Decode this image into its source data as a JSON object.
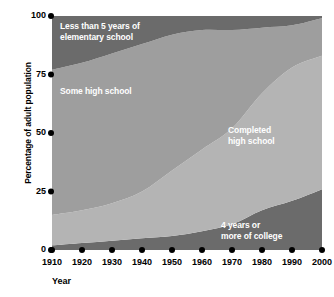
{
  "chart_data": {
    "type": "area",
    "title": "",
    "xlabel": "Year",
    "ylabel": "Percentage of adult population",
    "xlim": [
      1910,
      2000
    ],
    "ylim": [
      0,
      100
    ],
    "grid": false,
    "legend_position": "inside-plot-labels",
    "stacked": true,
    "x": [
      1910,
      1920,
      1930,
      1940,
      1950,
      1960,
      1970,
      1980,
      1990,
      2000
    ],
    "xtick_labels": [
      "1910",
      "1920",
      "1930",
      "1940",
      "1950",
      "1960",
      "1970",
      "1980",
      "1990",
      "2000"
    ],
    "ytick_labels": [
      "0",
      "25",
      "50",
      "75",
      "100"
    ],
    "ytick_values": [
      0,
      25,
      50,
      75,
      100
    ],
    "series": [
      {
        "name": "4 years or more of college",
        "label_text": "4 years or\nmore of college",
        "color": "#6b6b6b",
        "values": [
          2,
          3,
          4,
          5,
          6,
          8,
          11,
          17,
          21,
          26
        ],
        "cumulative_top": [
          2,
          3,
          4,
          5,
          6,
          8,
          11,
          17,
          21,
          26
        ]
      },
      {
        "name": "Completed high school",
        "label_text": "Completed\nhigh school",
        "color": "#b4b4b4",
        "values": [
          13,
          14,
          16,
          20,
          28,
          35,
          41,
          50,
          57,
          57
        ],
        "cumulative_top": [
          15,
          17,
          20,
          25,
          34,
          43,
          52,
          67,
          78,
          83
        ]
      },
      {
        "name": "Some high school",
        "label_text": "Some high school",
        "color": "#9e9e9e",
        "values": [
          62,
          63,
          64,
          63,
          58,
          51,
          42,
          28,
          18,
          16
        ],
        "cumulative_top": [
          77,
          80,
          84,
          88,
          92,
          94,
          94,
          95,
          96,
          99
        ]
      },
      {
        "name": "Less than 5 years of elementary school",
        "label_text": "Less than 5 years of\nelementary school",
        "color": "#6b6b6b",
        "values": [
          23,
          20,
          16,
          12,
          8,
          6,
          6,
          5,
          4,
          1
        ],
        "cumulative_top": [
          100,
          100,
          100,
          100,
          100,
          100,
          100,
          100,
          100,
          100
        ]
      }
    ]
  },
  "axes": {
    "y_title": "Percentage of adult population",
    "x_title": "Year",
    "tick_dot_color": "#000000"
  },
  "colors": {
    "background": "#ffffff",
    "band_dark": "#6b6b6b",
    "band_medium": "#9e9e9e",
    "band_light": "#b4b4b4",
    "label_text": "#ffffff",
    "axis_text": "#000000"
  }
}
